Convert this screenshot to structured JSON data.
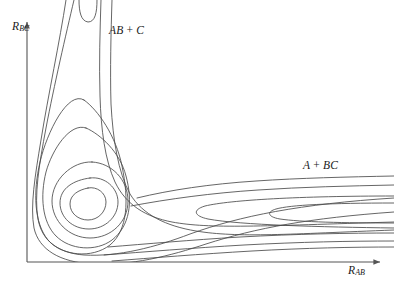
{
  "figure": {
    "name": "potential-energy-surface-contour-plot",
    "background_color": "#ffffff",
    "line_color": "#4a4a4a",
    "axis_color": "#555555",
    "text_color": "#1a1a1a"
  },
  "axes": {
    "x": {
      "label_base": "R",
      "label_sub": "AB",
      "arrow": true
    },
    "y": {
      "label_base": "R",
      "label_sub": "BC",
      "arrow": true
    }
  },
  "annotations": {
    "products": {
      "left": "AB",
      "op": " + ",
      "right": "C"
    },
    "reactants": {
      "left": "A",
      "op": " + ",
      "right": "BC"
    }
  },
  "chart_data": {
    "type": "line",
    "title": "",
    "xlabel": "R_AB",
    "ylabel": "R_BC",
    "grid": false,
    "legend": null,
    "axis_ranges": {
      "x": [
        27,
        384
      ],
      "y": [
        262,
        18
      ]
    },
    "contour_count": 9,
    "well_center": {
      "x": 88,
      "y": 202
    },
    "annotations_on_plot": [
      {
        "text": "AB + C",
        "x": 109,
        "y": 30,
        "meaning": "product exit channel"
      },
      {
        "text": "A + BC",
        "x": 303,
        "y": 165,
        "meaning": "reactant entrance channel"
      }
    ],
    "features": [
      {
        "kind": "exit-channel",
        "orientation": "vertical",
        "label": "AB + C"
      },
      {
        "kind": "entrance-channel",
        "orientation": "horizontal",
        "label": "A + BC"
      },
      {
        "kind": "potential-well",
        "shape": "nested-closed-contours",
        "location": "elbow-corner"
      },
      {
        "kind": "saddle",
        "location": "entrance-channel",
        "tips": [
          {
            "x": 190,
            "y": 213
          },
          {
            "x": 265,
            "y": 212
          }
        ]
      }
    ],
    "curves": [
      {
        "id": "c1-innermost-well",
        "closed": true,
        "path": "M 88 188 C 97 186 106 193 106 202 C 106 212 98 220 88 220 C 78 220 70 213 70 204 C 70 195 78 190 88 188 Z"
      },
      {
        "id": "c2-well",
        "closed": true,
        "path": "M 90 178 C 105 176 118 188 118 202 C 118 217 105 229 89 229 C 72 229 60 217 60 203 C 60 188 74 180 90 178 Z"
      },
      {
        "id": "c3-well-elongating",
        "closed": true,
        "path": "M 92 162 C 112 163 128 180 128 201 C 128 222 111 238 90 238 C 69 238 52 221 52 201 C 52 180 72 161 92 162 Z"
      },
      {
        "id": "c4-tongue-up",
        "closed": true,
        "path": "M 86 128 C 100 134 120 152 126 176 C 133 202 130 226 112 240 C 96 252 70 250 56 236 C 42 222 40 196 46 172 C 52 150 70 122 86 128 Z"
      },
      {
        "id": "c5-tongue-up-taller",
        "closed": true,
        "path": "M 84 100 C 98 110 116 136 122 166 C 129 200 128 230 110 245 C 92 259 62 256 48 240 C 34 223 33 192 40 162 C 47 132 68 90 84 100 Z"
      },
      {
        "id": "c6-channel-open",
        "open": true,
        "path": "M 74 0 C 66 34 54 86 46 128 C 39 165 34 196 38 219 C 42 241 58 253 84 255 C 118 257 156 247 190 234 C 240 216 300 204 394 198"
      },
      {
        "id": "c7-channel-open",
        "open": true,
        "path": "M 66 0 C 60 40 48 96 41 140 C 35 176 30 206 34 228 C 39 250 60 262 92 264 C 130 266 170 256 206 244 C 256 228 310 218 394 212"
      },
      {
        "id": "c8-inner-right-wall",
        "open": true,
        "path": "M 101 0 C 100 30 99 64 100 96 C 101 130 105 160 115 182 C 126 205 146 217 172 222 C 210 229 260 226 394 222"
      },
      {
        "id": "c9-outer-right-wall",
        "open": true,
        "path": "M 112 0 C 111 32 110 70 111 104 C 113 140 118 172 130 194 C 143 215 166 226 196 231 C 238 238 290 234 394 230"
      },
      {
        "id": "c10-upper-u-tip",
        "open": true,
        "path": "M 79 0 C 79 12 81 21 88 22 C 95 22 97 13 97 0"
      },
      {
        "id": "c11-entrance-top",
        "open": true,
        "path": "M 137 198 C 170 190 210 184 256 181 C 300 178 346 177 394 176"
      },
      {
        "id": "c12-entrance-top2",
        "open": true,
        "path": "M 131 206 C 168 199 212 193 258 190 C 302 187 348 186 394 185"
      },
      {
        "id": "c13-saddle-tip-inner",
        "open": true,
        "path": "M 394 203 C 330 203 290 205 276 209 C 266 212 268 217 280 219 C 300 222 344 223 394 223"
      },
      {
        "id": "c14-saddle-tip-outer",
        "open": true,
        "path": "M 394 196 C 300 196 230 200 205 206 C 192 210 194 216 208 219 C 240 225 320 227 394 228"
      },
      {
        "id": "c15-lower-entrance",
        "open": true,
        "path": "M 108 247 C 146 244 190 240 240 237 C 296 234 348 233 394 233"
      },
      {
        "id": "c16-lower-entrance2",
        "open": true,
        "path": "M 104 255 C 144 252 192 248 244 245 C 300 242 350 241 394 241"
      },
      {
        "id": "c17-lower-entrance3",
        "open": true,
        "path": "M 112 261 C 152 258 200 254 252 251 C 306 248 352 247 394 247"
      }
    ]
  }
}
